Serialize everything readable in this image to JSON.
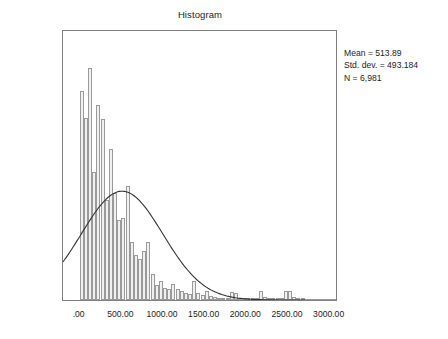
{
  "chart_data": {
    "type": "bar",
    "title": "Histogram",
    "xlabel": "",
    "ylabel": "Frequency",
    "xlim": [
      -200,
      3100
    ],
    "ylim": [
      0,
      870
    ],
    "grid": false,
    "legend": null,
    "bin_width": 50,
    "x_ticks": [
      {
        "value": 0,
        "label": ".00"
      },
      {
        "value": 500,
        "label": "500.00"
      },
      {
        "value": 1000,
        "label": "1000.00"
      },
      {
        "value": 1500,
        "label": "1500.00"
      },
      {
        "value": 2000,
        "label": "2000.00"
      },
      {
        "value": 2500,
        "label": "2500.00"
      },
      {
        "value": 3000,
        "label": "3000.00"
      }
    ],
    "y_ticks": [
      {
        "value": 0,
        "label": "0"
      },
      {
        "value": 200,
        "label": "200"
      },
      {
        "value": 400,
        "label": "400"
      },
      {
        "value": 600,
        "label": "600"
      },
      {
        "value": 800,
        "label": "800"
      }
    ],
    "bins": [
      {
        "x": 25,
        "value": 670
      },
      {
        "x": 75,
        "value": 585
      },
      {
        "x": 125,
        "value": 745
      },
      {
        "x": 175,
        "value": 410
      },
      {
        "x": 225,
        "value": 625
      },
      {
        "x": 275,
        "value": 580
      },
      {
        "x": 325,
        "value": 320
      },
      {
        "x": 375,
        "value": 485
      },
      {
        "x": 425,
        "value": 345
      },
      {
        "x": 475,
        "value": 258
      },
      {
        "x": 525,
        "value": 262
      },
      {
        "x": 575,
        "value": 365
      },
      {
        "x": 625,
        "value": 185
      },
      {
        "x": 675,
        "value": 145
      },
      {
        "x": 725,
        "value": 132
      },
      {
        "x": 775,
        "value": 158
      },
      {
        "x": 825,
        "value": 185
      },
      {
        "x": 875,
        "value": 82
      },
      {
        "x": 925,
        "value": 48
      },
      {
        "x": 975,
        "value": 62
      },
      {
        "x": 1025,
        "value": 38
      },
      {
        "x": 1075,
        "value": 36
      },
      {
        "x": 1125,
        "value": 52
      },
      {
        "x": 1175,
        "value": 34
      },
      {
        "x": 1225,
        "value": 30
      },
      {
        "x": 1275,
        "value": 22
      },
      {
        "x": 1325,
        "value": 20
      },
      {
        "x": 1375,
        "value": 62
      },
      {
        "x": 1425,
        "value": 22
      },
      {
        "x": 1475,
        "value": 16
      },
      {
        "x": 1525,
        "value": 30
      },
      {
        "x": 1575,
        "value": 12
      },
      {
        "x": 1625,
        "value": 10
      },
      {
        "x": 1675,
        "value": 8
      },
      {
        "x": 1725,
        "value": 6
      },
      {
        "x": 1775,
        "value": 4
      },
      {
        "x": 1825,
        "value": 26
      },
      {
        "x": 1875,
        "value": 22
      },
      {
        "x": 1925,
        "value": 6
      },
      {
        "x": 1975,
        "value": 4
      },
      {
        "x": 2025,
        "value": 4
      },
      {
        "x": 2075,
        "value": 2
      },
      {
        "x": 2125,
        "value": 6
      },
      {
        "x": 2175,
        "value": 30
      },
      {
        "x": 2225,
        "value": 10
      },
      {
        "x": 2275,
        "value": 2
      },
      {
        "x": 2325,
        "value": 2
      },
      {
        "x": 2375,
        "value": 2
      },
      {
        "x": 2425,
        "value": 6
      },
      {
        "x": 2475,
        "value": 28
      },
      {
        "x": 2525,
        "value": 30
      },
      {
        "x": 2575,
        "value": 10
      },
      {
        "x": 2625,
        "value": 4
      },
      {
        "x": 2675,
        "value": 8
      }
    ],
    "normal_curve": {
      "mean": 513.89,
      "std_dev": 493.184,
      "peak_value": 352,
      "description": "Overlaid normal distribution curve"
    },
    "annotations": {
      "mean": "Mean = 513.89",
      "std_dev": "Std. dev. = 493.184",
      "n": "N = 6,981"
    }
  },
  "colors": {
    "bar_fill": "#f0f0f0",
    "bar_stroke": "#9a9a9a",
    "frame": "#808080",
    "curve": "#333333",
    "text": "#1c1c1c"
  }
}
